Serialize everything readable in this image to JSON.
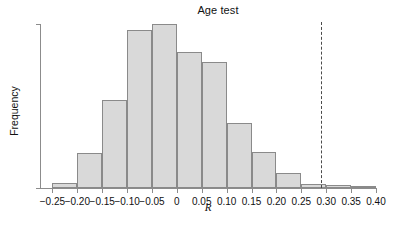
{
  "chart_data": {
    "type": "bar",
    "title": "Age test",
    "xlabel": "R",
    "ylabel": "Frequency",
    "categories": [
      "-0.25 to -0.20",
      "-0.20 to -0.15",
      "-0.15 to -0.10",
      "-0.10 to -0.05",
      "-0.05 to 0",
      "0 to 0.05",
      "0.05 to 0.10",
      "0.10 to 0.15",
      "0.15 to 0.20",
      "0.20 to 0.25",
      "0.25 to 0.30",
      "0.30 to 0.35",
      "0.35 to 0.40"
    ],
    "bin_edges": [
      -0.25,
      -0.2,
      -0.15,
      -0.1,
      -0.05,
      0.0,
      0.05,
      0.1,
      0.15,
      0.2,
      0.25,
      0.3,
      0.35,
      0.4
    ],
    "values": [
      6,
      41,
      104,
      186,
      193,
      160,
      148,
      77,
      42,
      18,
      5,
      3,
      1
    ],
    "xlim": [
      -0.275,
      0.4
    ],
    "ylim": [
      0,
      193
    ],
    "grid": false,
    "legend": null,
    "xtick_labels": [
      "-0.25",
      "-0.20",
      "-0.15",
      "-0.10",
      "-0.05",
      "0",
      "0.05",
      "0.10",
      "0.15",
      "0.20",
      "0.25",
      "0.30",
      "0.35",
      "0.40"
    ],
    "xtick_values": [
      -0.25,
      -0.2,
      -0.15,
      -0.1,
      -0.05,
      0.0,
      0.05,
      0.1,
      0.15,
      0.2,
      0.25,
      0.3,
      0.35,
      0.4
    ],
    "ytick_labels": [
      "0",
      "193"
    ],
    "ytick_values": [
      0,
      193
    ],
    "annotations": [
      {
        "name": "threshold-line",
        "type": "vline",
        "x": 0.29,
        "style": "dashed",
        "color": "#4a4a4a"
      }
    ],
    "bar_color": "#d9d9d9",
    "bar_edge_color": "#8a8a8a",
    "axis_color": "#8c8c8c"
  },
  "axis": {
    "y_top_label": "193",
    "y_bottom_label": "0"
  }
}
